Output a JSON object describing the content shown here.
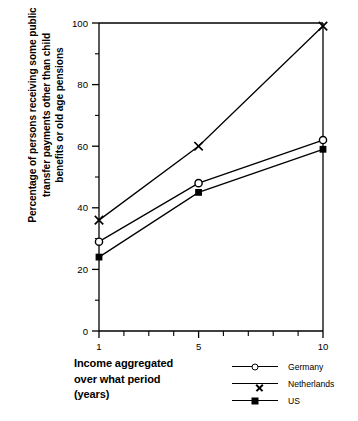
{
  "chart_data": {
    "type": "line",
    "title": "",
    "xlabel": "Income aggregated\nover what period\n(years)",
    "ylabel": "Percentage of persons receiving some public\ntransfer payments other than child\nbenefits or old age pensions",
    "x": [
      1,
      5,
      10
    ],
    "xlim": [
      1,
      10
    ],
    "ylim": [
      0,
      100
    ],
    "xticks": [
      1,
      2,
      3,
      4,
      5,
      6,
      7,
      8,
      9,
      10
    ],
    "xtick_labels": [
      "1",
      "",
      "",
      "",
      "5",
      "",
      "",
      "",
      "",
      "10"
    ],
    "yticks": [
      0,
      10,
      20,
      30,
      40,
      50,
      60,
      70,
      80,
      90,
      100
    ],
    "ytick_labels": [
      "0",
      "",
      "20",
      "",
      "40",
      "",
      "60",
      "",
      "80",
      "",
      "100"
    ],
    "grid": false,
    "legend_position": "bottom-right",
    "series": [
      {
        "name": "Germany",
        "marker": "circle-open",
        "values": [
          29,
          48,
          62
        ]
      },
      {
        "name": "Netherlands",
        "marker": "cross",
        "values": [
          36,
          60,
          99
        ]
      },
      {
        "name": "US",
        "marker": "square-filled",
        "values": [
          24,
          45,
          59
        ]
      }
    ]
  },
  "axis": {
    "y_tick_100": "100",
    "y_tick_80": "80",
    "y_tick_60": "60",
    "y_tick_40": "40",
    "y_tick_20": "20",
    "y_tick_0": "0",
    "x_tick_1": "1",
    "x_tick_5": "5",
    "x_tick_10": "10"
  },
  "labels": {
    "y_axis_title": "Percentage of persons receiving some public\ntransfer payments other than child\nbenefits or old age pensions",
    "x_axis_title": "Income aggregated\nover what period\n(years)"
  },
  "legend": {
    "items": [
      {
        "label": "Germany"
      },
      {
        "label": "Netherlands"
      },
      {
        "label": "US"
      }
    ]
  },
  "colors": {
    "line": "#000000",
    "background": "#ffffff",
    "text": "#000000"
  }
}
